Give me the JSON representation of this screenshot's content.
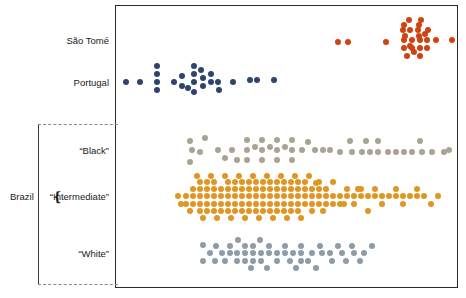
{
  "figure": {
    "type": "strip-plot",
    "background": "#ffffff",
    "frame": {
      "x": 115,
      "y": 5,
      "width": 343,
      "height": 283,
      "border_color": "#2b2b2b"
    }
  },
  "labels": {
    "sao_tome": "São Tomé",
    "portugal": "Portugal",
    "brazil": "Brazil",
    "black": "“Black”",
    "intermediate": "“Intermediate”",
    "white": "“White”"
  },
  "colors": {
    "sao_tome": "#cf4311",
    "portugal": "#2f4570",
    "black": "#a8a392",
    "intermediate": "#e09622",
    "white": "#8d9ca6",
    "frame": "#2b2b2b",
    "bracket_solid": "#3a3a3a",
    "bracket_dash": "#8a8a8a"
  },
  "chart_data": {
    "type": "scatter",
    "title": "",
    "xlabel": "",
    "ylabel": "",
    "grid": false,
    "legend": "none",
    "categories": [
      "São Tomé",
      "Portugal",
      "“Black”",
      "“Intermediate”",
      "“White”"
    ],
    "group_bracket": {
      "label": "Brazil",
      "members": [
        "“Black”",
        "“Intermediate”",
        "“White”"
      ]
    },
    "xlim": [
      0,
      100
    ],
    "series": [
      {
        "name": "São Tomé",
        "color": "#cf4311",
        "row_center_px": 40,
        "point_radius_px": 3.0,
        "count": 28,
        "points": [
          [
            338,
            42
          ],
          [
            348,
            42
          ],
          [
            386,
            42
          ],
          [
            409,
            20
          ],
          [
            421,
            20
          ],
          [
            403,
            30
          ],
          [
            410,
            30
          ],
          [
            418,
            30
          ],
          [
            428,
            30
          ],
          [
            404,
            40
          ],
          [
            412,
            40
          ],
          [
            420,
            40
          ],
          [
            427,
            40
          ],
          [
            436,
            40
          ],
          [
            452,
            40
          ],
          [
            404,
            48
          ],
          [
            412,
            48
          ],
          [
            420,
            48
          ],
          [
            427,
            48
          ],
          [
            405,
            36
          ],
          [
            419,
            36
          ],
          [
            407,
            56
          ],
          [
            420,
            56
          ],
          [
            404,
            25
          ],
          [
            419,
            25
          ],
          [
            410,
            46
          ],
          [
            425,
            34
          ],
          [
            414,
            52
          ]
        ]
      },
      {
        "name": "Portugal",
        "color": "#2f4570",
        "row_center_px": 82,
        "point_radius_px": 3.0,
        "count": 25,
        "points": [
          [
            126,
            82
          ],
          [
            140,
            82
          ],
          [
            157,
            66
          ],
          [
            157,
            74
          ],
          [
            157,
            82
          ],
          [
            157,
            90
          ],
          [
            174,
            82
          ],
          [
            182,
            76
          ],
          [
            182,
            86
          ],
          [
            194,
            66
          ],
          [
            194,
            74
          ],
          [
            194,
            82
          ],
          [
            194,
            92
          ],
          [
            203,
            78
          ],
          [
            203,
            86
          ],
          [
            211,
            82
          ],
          [
            211,
            74
          ],
          [
            218,
            82
          ],
          [
            219,
            90
          ],
          [
            233,
            82
          ],
          [
            250,
            80
          ],
          [
            257,
            80
          ],
          [
            274,
            80
          ],
          [
            201,
            70
          ],
          [
            188,
            88
          ]
        ]
      },
      {
        "name": "“Black”",
        "color": "#a8a392",
        "row_center_px": 150,
        "point_radius_px": 3.0,
        "count": 46,
        "points": [
          [
            190,
            141
          ],
          [
            205,
            138
          ],
          [
            192,
            150
          ],
          [
            200,
            152
          ],
          [
            190,
            162
          ],
          [
            232,
            150
          ],
          [
            247,
            140
          ],
          [
            247,
            150
          ],
          [
            247,
            160
          ],
          [
            262,
            140
          ],
          [
            262,
            150
          ],
          [
            262,
            160
          ],
          [
            277,
            140
          ],
          [
            277,
            150
          ],
          [
            277,
            160
          ],
          [
            292,
            140
          ],
          [
            292,
            150
          ],
          [
            292,
            160
          ],
          [
            302,
            150
          ],
          [
            315,
            150
          ],
          [
            323,
            150
          ],
          [
            330,
            150
          ],
          [
            350,
            141
          ],
          [
            352,
            152
          ],
          [
            362,
            152
          ],
          [
            370,
            152
          ],
          [
            378,
            141
          ],
          [
            378,
            152
          ],
          [
            388,
            152
          ],
          [
            396,
            152
          ],
          [
            404,
            152
          ],
          [
            412,
            152
          ],
          [
            420,
            141
          ],
          [
            422,
            152
          ],
          [
            432,
            152
          ],
          [
            444,
            152
          ],
          [
            449,
            150
          ],
          [
            218,
            150
          ],
          [
            225,
            158
          ],
          [
            237,
            160
          ],
          [
            255,
            147
          ],
          [
            270,
            147
          ],
          [
            285,
            147
          ],
          [
            308,
            142
          ],
          [
            340,
            152
          ],
          [
            366,
            141
          ]
        ]
      },
      {
        "name": "“Intermediate”",
        "color": "#e09622",
        "row_center_px": 196,
        "point_radius_px": 3.0,
        "count": 150,
        "points": [
          [
            186,
            196
          ],
          [
            186,
            204
          ],
          [
            193,
            189
          ],
          [
            193,
            196
          ],
          [
            193,
            204
          ],
          [
            200,
            182
          ],
          [
            200,
            189
          ],
          [
            200,
            196
          ],
          [
            200,
            204
          ],
          [
            200,
            211
          ],
          [
            207,
            182
          ],
          [
            207,
            189
          ],
          [
            207,
            196
          ],
          [
            207,
            204
          ],
          [
            207,
            211
          ],
          [
            214,
            182
          ],
          [
            214,
            189
          ],
          [
            214,
            196
          ],
          [
            214,
            204
          ],
          [
            214,
            211
          ],
          [
            221,
            189
          ],
          [
            221,
            196
          ],
          [
            221,
            204
          ],
          [
            221,
            211
          ],
          [
            228,
            182
          ],
          [
            228,
            189
          ],
          [
            228,
            196
          ],
          [
            228,
            204
          ],
          [
            228,
            211
          ],
          [
            235,
            182
          ],
          [
            235,
            189
          ],
          [
            235,
            196
          ],
          [
            235,
            204
          ],
          [
            235,
            211
          ],
          [
            242,
            182
          ],
          [
            242,
            189
          ],
          [
            242,
            196
          ],
          [
            242,
            204
          ],
          [
            242,
            211
          ],
          [
            249,
            182
          ],
          [
            249,
            189
          ],
          [
            249,
            196
          ],
          [
            249,
            204
          ],
          [
            249,
            211
          ],
          [
            256,
            182
          ],
          [
            256,
            189
          ],
          [
            256,
            196
          ],
          [
            256,
            204
          ],
          [
            256,
            211
          ],
          [
            263,
            182
          ],
          [
            263,
            189
          ],
          [
            263,
            196
          ],
          [
            263,
            204
          ],
          [
            263,
            211
          ],
          [
            270,
            182
          ],
          [
            270,
            189
          ],
          [
            270,
            196
          ],
          [
            270,
            204
          ],
          [
            270,
            211
          ],
          [
            277,
            182
          ],
          [
            277,
            189
          ],
          [
            277,
            196
          ],
          [
            277,
            204
          ],
          [
            277,
            211
          ],
          [
            284,
            182
          ],
          [
            284,
            189
          ],
          [
            284,
            196
          ],
          [
            284,
            204
          ],
          [
            284,
            211
          ],
          [
            291,
            182
          ],
          [
            291,
            189
          ],
          [
            291,
            196
          ],
          [
            291,
            204
          ],
          [
            291,
            211
          ],
          [
            298,
            182
          ],
          [
            298,
            189
          ],
          [
            298,
            196
          ],
          [
            298,
            204
          ],
          [
            298,
            211
          ],
          [
            305,
            182
          ],
          [
            305,
            189
          ],
          [
            305,
            196
          ],
          [
            305,
            204
          ],
          [
            312,
            189
          ],
          [
            312,
            196
          ],
          [
            312,
            204
          ],
          [
            312,
            211
          ],
          [
            319,
            182
          ],
          [
            319,
            189
          ],
          [
            319,
            196
          ],
          [
            319,
            204
          ],
          [
            326,
            189
          ],
          [
            326,
            196
          ],
          [
            326,
            204
          ],
          [
            333,
            182
          ],
          [
            333,
            196
          ],
          [
            333,
            204
          ],
          [
            340,
            196
          ],
          [
            340,
            204
          ],
          [
            347,
            189
          ],
          [
            347,
            196
          ],
          [
            354,
            196
          ],
          [
            354,
            204
          ],
          [
            361,
            189
          ],
          [
            361,
            196
          ],
          [
            368,
            196
          ],
          [
            368,
            211
          ],
          [
            375,
            189
          ],
          [
            375,
            196
          ],
          [
            382,
            196
          ],
          [
            382,
            204
          ],
          [
            389,
            196
          ],
          [
            396,
            189
          ],
          [
            396,
            196
          ],
          [
            403,
            196
          ],
          [
            403,
            204
          ],
          [
            410,
            196
          ],
          [
            417,
            189
          ],
          [
            417,
            196
          ],
          [
            424,
            196
          ],
          [
            431,
            204
          ],
          [
            438,
            196
          ],
          [
            178,
            196
          ],
          [
            181,
            204
          ],
          [
            190,
            211
          ],
          [
            197,
            176
          ],
          [
            211,
            176
          ],
          [
            225,
            176
          ],
          [
            239,
            176
          ],
          [
            253,
            176
          ],
          [
            267,
            176
          ],
          [
            281,
            176
          ],
          [
            295,
            176
          ],
          [
            309,
            176
          ],
          [
            203,
            218
          ],
          [
            217,
            218
          ],
          [
            231,
            218
          ],
          [
            245,
            218
          ],
          [
            259,
            218
          ],
          [
            273,
            218
          ],
          [
            287,
            218
          ],
          [
            301,
            218
          ],
          [
            316,
            183
          ],
          [
            323,
            211
          ],
          [
            344,
            204
          ],
          [
            358,
            189
          ]
        ]
      },
      {
        "name": "“White”",
        "color": "#8d9ca6",
        "row_center_px": 253,
        "point_radius_px": 3.0,
        "count": 50,
        "points": [
          [
            203,
            245
          ],
          [
            210,
            253
          ],
          [
            203,
            261
          ],
          [
            222,
            253
          ],
          [
            230,
            246
          ],
          [
            230,
            253
          ],
          [
            237,
            253
          ],
          [
            237,
            261
          ],
          [
            245,
            246
          ],
          [
            245,
            253
          ],
          [
            245,
            261
          ],
          [
            253,
            246
          ],
          [
            253,
            253
          ],
          [
            253,
            261
          ],
          [
            261,
            253
          ],
          [
            261,
            261
          ],
          [
            269,
            246
          ],
          [
            269,
            253
          ],
          [
            277,
            253
          ],
          [
            277,
            261
          ],
          [
            285,
            246
          ],
          [
            285,
            253
          ],
          [
            293,
            253
          ],
          [
            301,
            246
          ],
          [
            301,
            253
          ],
          [
            301,
            261
          ],
          [
            312,
            253
          ],
          [
            320,
            246
          ],
          [
            322,
            253
          ],
          [
            330,
            253
          ],
          [
            332,
            261
          ],
          [
            342,
            253
          ],
          [
            352,
            246
          ],
          [
            354,
            253
          ],
          [
            364,
            253
          ],
          [
            372,
            246
          ],
          [
            215,
            261
          ],
          [
            225,
            261
          ],
          [
            251,
            268
          ],
          [
            267,
            268
          ],
          [
            216,
            246
          ],
          [
            238,
            240
          ],
          [
            260,
            240
          ],
          [
            290,
            261
          ],
          [
            296,
            268
          ],
          [
            308,
            261
          ],
          [
            316,
            268
          ],
          [
            338,
            246
          ],
          [
            346,
            261
          ],
          [
            360,
            261
          ]
        ]
      }
    ]
  }
}
